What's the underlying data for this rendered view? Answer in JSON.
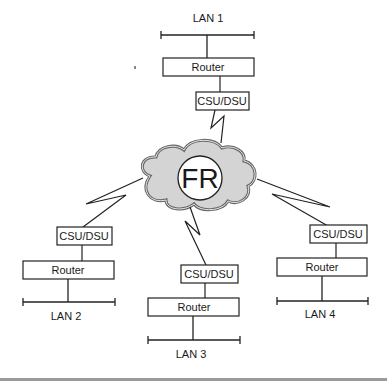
{
  "diagram": {
    "cloud": {
      "label": "FR",
      "fill": "#d4d4d4",
      "stroke": "#555555"
    },
    "sites": [
      {
        "id": "site-1",
        "lan_label": "LAN 1",
        "router_label": "Router",
        "csu_label": "CSU/DSU"
      },
      {
        "id": "site-2",
        "lan_label": "LAN 2",
        "router_label": "Router",
        "csu_label": "CSU/DSU"
      },
      {
        "id": "site-3",
        "lan_label": "LAN 3",
        "router_label": "Router",
        "csu_label": "CSU/DSU"
      },
      {
        "id": "site-4",
        "lan_label": "LAN 4",
        "router_label": "Router",
        "csu_label": "CSU/DSU"
      }
    ],
    "colors": {
      "line": "#222222",
      "box_stroke": "#222222",
      "footer_bar": "#9a9a9a"
    }
  }
}
